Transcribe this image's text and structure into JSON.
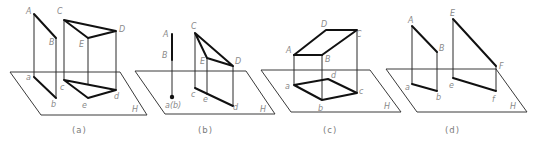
{
  "figures": [
    {
      "id": "a",
      "caption": "(a)",
      "plane_label": "H",
      "points_upper": {
        "A": "A",
        "B": "B",
        "C": "C",
        "D": "D",
        "E": "E"
      },
      "points_lower": {
        "a": "a",
        "b": "b",
        "c": "c",
        "d": "d",
        "e": "e"
      }
    },
    {
      "id": "b",
      "caption": "(b)",
      "plane_label": "H",
      "points_upper": {
        "A": "A",
        "B": "B",
        "C": "C",
        "D": "D",
        "E": "E"
      },
      "points_lower": {
        "ab": "a(b)",
        "c": "c",
        "d": "d",
        "e": "e"
      }
    },
    {
      "id": "c",
      "caption": "(c)",
      "plane_label": "H",
      "points_upper": {
        "A": "A",
        "B": "B",
        "C": "C",
        "D": "D"
      },
      "points_lower": {
        "a": "a",
        "b": "b",
        "c": "c",
        "d": "d"
      }
    },
    {
      "id": "d",
      "caption": "(d)",
      "plane_label": "H",
      "points_upper": {
        "A": "A",
        "B": "B",
        "E": "E",
        "F": "F"
      },
      "points_lower": {
        "a": "a",
        "b": "b",
        "e": "e",
        "f": "f"
      }
    }
  ]
}
